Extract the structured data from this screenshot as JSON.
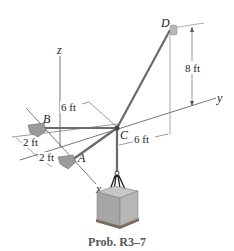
{
  "figure": {
    "caption": "Prob. R3–7",
    "axes": {
      "x": "x",
      "y": "y",
      "z": "z"
    },
    "points": {
      "A": "A",
      "B": "B",
      "C": "C",
      "D": "D"
    },
    "dimensions": {
      "d_height": "8 ft",
      "c_offset_x": "6 ft",
      "c_offset_y": "6 ft",
      "b_offset": "2 ft",
      "a_offset": "2 ft"
    },
    "colors": {
      "cable": "#6a6a6a",
      "axis": "#555555",
      "support": "#9a9a9a",
      "crate": "#a8a8a8"
    }
  }
}
